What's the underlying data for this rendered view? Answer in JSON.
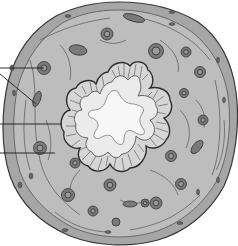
{
  "figure": {
    "type": "histology-cross-section",
    "labels_visible": false,
    "leader_lines": [
      {
        "name": "leader-line-1",
        "x1": 0,
        "y1": 68,
        "x2": 44,
        "y2": 68
      },
      {
        "name": "leader-line-2",
        "x1": 0,
        "y1": 75,
        "x2": 36,
        "y2": 104
      },
      {
        "name": "leader-line-3",
        "x1": 0,
        "y1": 124,
        "x2": 62,
        "y2": 124
      },
      {
        "name": "leader-line-4",
        "x1": 0,
        "y1": 153,
        "x2": 55,
        "y2": 153
      }
    ],
    "colors": {
      "background": "#ffffff",
      "outer_layer": "#a6a6a6",
      "wall": "#bdbdbd",
      "mucosa_cells": "#d6d6d6",
      "lumen": "#f4f4f4",
      "outline": "#3a3a3a",
      "vessel_fill": "#7a7a7a",
      "vessel_inner": "#9a9a9a"
    }
  }
}
